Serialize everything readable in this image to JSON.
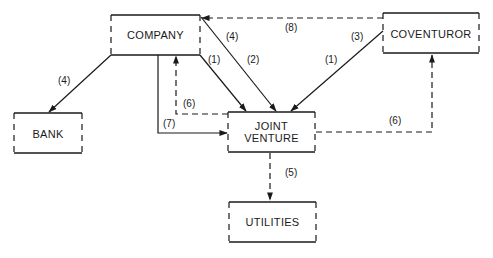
{
  "diagram": {
    "nodes": {
      "company": {
        "label": "COMPANY"
      },
      "coventuror": {
        "label": "COVENTUROR"
      },
      "bank": {
        "label": "BANK"
      },
      "joint_venture": {
        "line1": "JOINT",
        "line2": "VENTURE"
      },
      "utilities": {
        "label": "UTILITIES"
      }
    },
    "edges": [
      {
        "id": "company-to-bank",
        "from": "COMPANY",
        "to": "BANK",
        "label": "(4)",
        "style": "solid"
      },
      {
        "id": "company-to-jv-1",
        "from": "COMPANY",
        "to": "JOINT VENTURE",
        "label": "(1)",
        "style": "solid"
      },
      {
        "id": "company-to-jv-4-2",
        "from": "COMPANY",
        "to": "JOINT VENTURE",
        "label_a": "(4)",
        "label_b": "(2)",
        "style": "solid"
      },
      {
        "id": "coventuror-to-jv",
        "from": "COVENTUROR",
        "to": "JOINT VENTURE",
        "label_a": "(3)",
        "label_b": "(1)",
        "style": "solid"
      },
      {
        "id": "coventuror-to-company",
        "from": "COVENTUROR",
        "to": "COMPANY",
        "label": "(8)",
        "style": "dashed"
      },
      {
        "id": "company-to-jv-7",
        "from": "COMPANY",
        "to": "JOINT VENTURE",
        "label": "(7)",
        "style": "solid"
      },
      {
        "id": "jv-to-company-6",
        "from": "JOINT VENTURE",
        "to": "COMPANY",
        "label": "(6)",
        "style": "dashed"
      },
      {
        "id": "jv-to-coventuror-6",
        "from": "JOINT VENTURE",
        "to": "COVENTUROR",
        "label": "(6)",
        "style": "dashed"
      },
      {
        "id": "jv-to-utilities",
        "from": "JOINT VENTURE",
        "to": "UTILITIES",
        "label": "(5)",
        "style": "dashed"
      }
    ]
  }
}
